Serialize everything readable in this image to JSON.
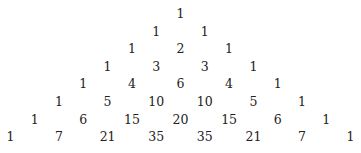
{
  "rows": [
    [
      "1"
    ],
    [
      "1",
      "1"
    ],
    [
      "1",
      "2",
      "1"
    ],
    [
      "1",
      "3",
      "3",
      "1"
    ],
    [
      "1",
      "4",
      "6",
      "4",
      "1"
    ],
    [
      "1",
      "5",
      "10",
      "10",
      "5",
      "1"
    ],
    [
      "1",
      "6",
      "15",
      "20",
      "15",
      "6",
      "1"
    ],
    [
      "1",
      "7",
      "21",
      "35",
      "35",
      "21",
      "7",
      "1"
    ]
  ]
}
